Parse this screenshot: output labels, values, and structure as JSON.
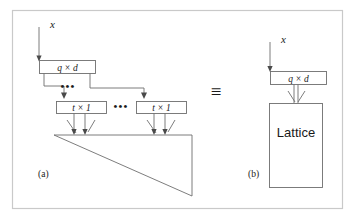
{
  "figure": {
    "background_color": "#ffffff",
    "frame_color": "#c9c9c9",
    "line_color": "#6e6e6e",
    "text_color": "#1a1a1a"
  },
  "panel_a": {
    "caption": "(a)",
    "input_label": "x",
    "top_box_label": "q × d",
    "mid_box_left_label": "t × 1",
    "mid_box_right_label": "t × 1",
    "ellipsis_upper": "•••",
    "ellipsis_mid": "•••",
    "triangle_description": "right-triangle"
  },
  "equivalence": {
    "symbol": "≡"
  },
  "panel_b": {
    "caption": "(b)",
    "input_label": "x",
    "top_box_label": "q × d",
    "lattice_box_label": "Lattice"
  }
}
